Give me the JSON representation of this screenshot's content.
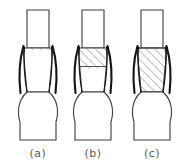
{
  "figure": {
    "background_color": "#ffffff",
    "outline_color": "#3c3c3c",
    "tool_color": "#141414",
    "hatch_color": "#6e6e6e",
    "caption_color": "#59595b",
    "panels": [
      {
        "id": "a",
        "caption": "(a)",
        "hatch_fraction": 0.0,
        "hatch_label": "no deformed zone",
        "stage": "initial contact"
      },
      {
        "id": "b",
        "caption": "(b)",
        "hatch_fraction": 0.42,
        "hatch_label": "upper deformed zone",
        "stage": "partial upset"
      },
      {
        "id": "c",
        "caption": "(c)",
        "hatch_fraction": 1.0,
        "hatch_label": "fully deformed zone",
        "stage": "complete upset"
      }
    ],
    "geometry": {
      "stem_top_y": 10,
      "stem_left_x": 20,
      "stem_right_x": 45,
      "zone_top_y": 48,
      "zone_bottom_y": 92,
      "zone_top_half_width": 15,
      "zone_bottom_half_width": 11,
      "bulge_bottom_y": 140,
      "bulge_half_width": 17
    }
  }
}
